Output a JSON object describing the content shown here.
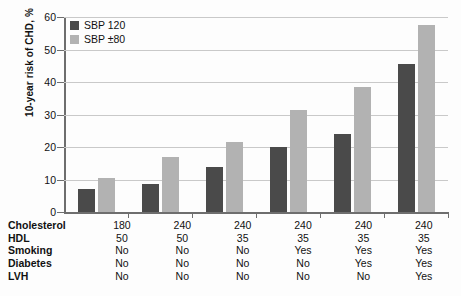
{
  "chart_data": {
    "type": "bar",
    "title": "",
    "xlabel": "",
    "ylabel": "10-year risk of CHD, %",
    "ylim": [
      0,
      60
    ],
    "yticks": [
      0,
      10,
      20,
      30,
      40,
      50,
      60
    ],
    "grid": true,
    "legend_position": "top-left",
    "categories": [
      "1",
      "2",
      "3",
      "4",
      "5",
      "6"
    ],
    "series": [
      {
        "name": "SBP 120",
        "color": "#4a4a4a",
        "values": [
          7,
          8.5,
          14,
          20,
          24,
          45.5
        ]
      },
      {
        "name": "SBP ±80",
        "color": "#b2b2b2",
        "values": [
          10.5,
          17,
          21.5,
          31.5,
          38.5,
          57.5
        ]
      }
    ],
    "risk_factor_table": {
      "rows": [
        {
          "label": "Cholesterol",
          "values": [
            "180",
            "240",
            "240",
            "240",
            "240",
            "240"
          ]
        },
        {
          "label": "HDL",
          "values": [
            "50",
            "50",
            "35",
            "35",
            "35",
            "35"
          ]
        },
        {
          "label": "Smoking",
          "values": [
            "No",
            "No",
            "No",
            "Yes",
            "Yes",
            "Yes"
          ]
        },
        {
          "label": "Diabetes",
          "values": [
            "No",
            "No",
            "No",
            "No",
            "Yes",
            "Yes"
          ]
        },
        {
          "label": "LVH",
          "values": [
            "No",
            "No",
            "No",
            "No",
            "No",
            "Yes"
          ]
        }
      ]
    }
  },
  "axis": {
    "ylabel": "10-year risk of CHD, %",
    "ticks": [
      "60",
      "50",
      "40",
      "30",
      "20",
      "10",
      "0"
    ]
  },
  "legend": {
    "items": [
      {
        "label": "SBP 120",
        "swatch": "dark"
      },
      {
        "label": "SBP ±80",
        "swatch": "light"
      }
    ]
  }
}
